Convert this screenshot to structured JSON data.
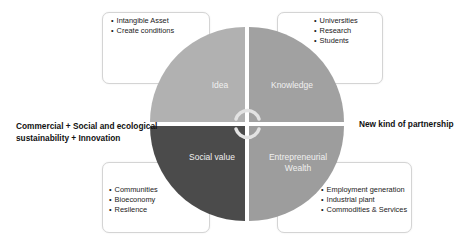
{
  "diagram": {
    "quadrants": [
      {
        "id": "idea",
        "label": "Idea",
        "color": "#b1b1b1"
      },
      {
        "id": "knowledge",
        "label": "Knowledge",
        "color": "#a0a0a0"
      },
      {
        "id": "social-value",
        "label": "Social value",
        "color": "#4a4a4a"
      },
      {
        "id": "entrepreneurial-wealth",
        "label_line1": "Entrepreneurial",
        "label_line2": "Wealth",
        "color": "#9c9c9c"
      }
    ],
    "boxes": {
      "top_left": [
        "Intangible Asset",
        "Create conditions"
      ],
      "top_right": [
        "Universities",
        "Research",
        "Students"
      ],
      "bottom_left": [
        "Communities",
        "Bioeconomy",
        "Resilence"
      ],
      "bottom_right": [
        "Employment generation",
        "Industrial plant",
        "Commodities & Services"
      ]
    },
    "left_label_line1": "Commercial + Social and ecological",
    "left_label_line2": "sustainability + Innovation",
    "right_label": "New kind of partnership",
    "center_icon": "cycle-arrows-icon"
  }
}
